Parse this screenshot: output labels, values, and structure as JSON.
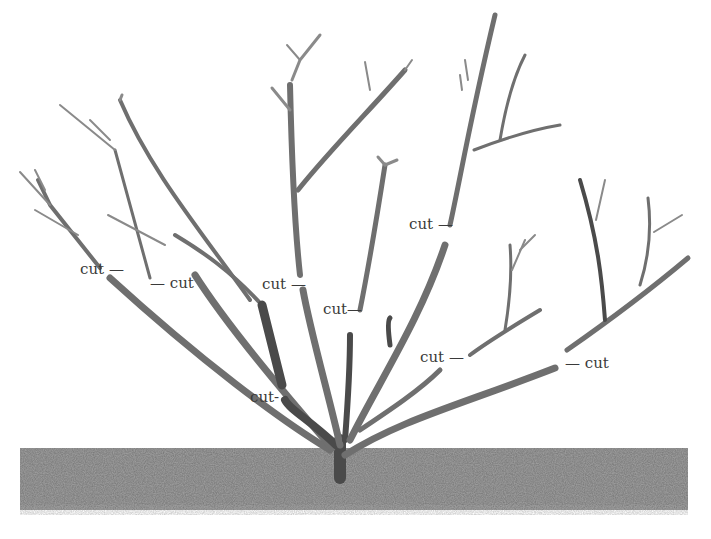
{
  "diagram": {
    "colors": {
      "branch": "#6f6f6f",
      "branch_dark": "#4a4a4a",
      "soil": "#6b6b6b",
      "text": "#3a3a3a",
      "background": "#ffffff"
    },
    "cut_labels": [
      {
        "id": "cut-1",
        "text": "cut",
        "dash": "—",
        "x": 80,
        "y": 262,
        "dash_side": "right"
      },
      {
        "id": "cut-2",
        "text": "cut",
        "dash": "—",
        "x": 150,
        "y": 276,
        "dash_side": "left"
      },
      {
        "id": "cut-3",
        "text": "cut",
        "dash": "—",
        "x": 262,
        "y": 277,
        "dash_side": "right"
      },
      {
        "id": "cut-4",
        "text": "cut",
        "dash": "—",
        "x": 323,
        "y": 302,
        "dash_side": "right"
      },
      {
        "id": "cut-5",
        "text": "cut",
        "dash": "—",
        "x": 409,
        "y": 217,
        "dash_side": "right"
      },
      {
        "id": "cut-6",
        "text": "cut",
        "dash": "—",
        "x": 420,
        "y": 350,
        "dash_side": "right"
      },
      {
        "id": "cut-7",
        "text": "cut",
        "dash": "—",
        "x": 565,
        "y": 356,
        "dash_side": "left"
      },
      {
        "id": "cut-8",
        "text": "cut",
        "dash": "-",
        "x": 250,
        "y": 390,
        "dash_side": "right"
      }
    ],
    "ground": {
      "label": "soil",
      "x": 20,
      "y": 448,
      "width": 668,
      "height": 62
    }
  }
}
